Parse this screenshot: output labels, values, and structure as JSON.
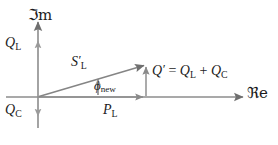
{
  "figure": {
    "type": "phasor-diagram",
    "background_color": "#ffffff",
    "line_color": "#7c7c7c",
    "text_color": "#1c1c1c"
  },
  "axes": {
    "imaginary": {
      "label": "ℑm",
      "name": "imaginary-axis",
      "direction": "vertical",
      "arrow": "up"
    },
    "real": {
      "label": "ℜe",
      "name": "real-axis",
      "direction": "horizontal",
      "arrow": "right"
    },
    "origin": {
      "x": 38,
      "y": 97
    }
  },
  "labels": {
    "q_l_axis": {
      "symbol": "Q",
      "subscript": "L",
      "text": "QL"
    },
    "q_c_axis": {
      "symbol": "Q",
      "subscript": "C",
      "text": "QC"
    },
    "s_l_prime": {
      "symbol": "S",
      "prime": "′",
      "subscript": "L",
      "text": "S′L"
    },
    "phi_new": {
      "symbol": "ϕ",
      "subscript": "new",
      "text": "ϕnew"
    },
    "p_l": {
      "symbol": "P",
      "subscript": "L",
      "text": "PL"
    },
    "q_sum": {
      "lhs_symbol": "Q",
      "lhs_prime": "′",
      "equals": "=",
      "term1_symbol": "Q",
      "term1_subscript": "L",
      "plus": "+",
      "term2_symbol": "Q",
      "term2_subscript": "C",
      "text": "Q′ = QL + QC"
    }
  },
  "vectors": [
    {
      "name": "apparent-power-vector",
      "label": "S′L",
      "from": {
        "x": 38,
        "y": 97
      },
      "to": {
        "x": 146,
        "y": 65
      },
      "arrow": true
    },
    {
      "name": "real-power-vector",
      "label": "PL",
      "from": {
        "x": 38,
        "y": 97
      },
      "to": {
        "x": 146,
        "y": 97
      },
      "arrow": true
    },
    {
      "name": "reactive-power-vector",
      "label": "Q′",
      "from": {
        "x": 146,
        "y": 97
      },
      "to": {
        "x": 146,
        "y": 65
      },
      "arrow": true
    },
    {
      "name": "inductive-reactive-marker",
      "label": "QL",
      "from": {
        "x": 38,
        "y": 56
      },
      "to": {
        "x": 38,
        "y": 40
      },
      "arrow": true
    },
    {
      "name": "capacitive-reactive-marker",
      "label": "QC",
      "from": {
        "x": 38,
        "y": 100
      },
      "to": {
        "x": 38,
        "y": 116
      },
      "arrow": true
    }
  ],
  "angle": {
    "name": "phase-angle-new",
    "label": "ϕnew",
    "vertex": {
      "x": 38,
      "y": 97
    },
    "between": [
      "real-power-vector",
      "apparent-power-vector"
    ],
    "indicator": "arc-arrow"
  },
  "caption": {
    "text": ""
  }
}
